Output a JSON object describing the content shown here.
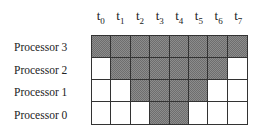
{
  "diagram": {
    "time_steps": [
      {
        "base": "t",
        "sub": "0"
      },
      {
        "base": "t",
        "sub": "1"
      },
      {
        "base": "t",
        "sub": "2"
      },
      {
        "base": "t",
        "sub": "3"
      },
      {
        "base": "t",
        "sub": "4"
      },
      {
        "base": "t",
        "sub": "5"
      },
      {
        "base": "t",
        "sub": "6"
      },
      {
        "base": "t",
        "sub": "7"
      }
    ],
    "rows": [
      {
        "label": "Processor 3",
        "active": [
          true,
          true,
          true,
          true,
          true,
          true,
          true,
          true
        ]
      },
      {
        "label": "Processor 2",
        "active": [
          false,
          true,
          true,
          true,
          true,
          true,
          true,
          false
        ]
      },
      {
        "label": "Processor 1",
        "active": [
          false,
          false,
          true,
          true,
          true,
          true,
          false,
          false
        ]
      },
      {
        "label": "Processor 0",
        "active": [
          false,
          false,
          false,
          true,
          true,
          false,
          false,
          false
        ]
      }
    ],
    "colors": {
      "busy_fill": "#8c8c8c",
      "idle_fill": "#ffffff",
      "grid_line": "#333333"
    }
  }
}
